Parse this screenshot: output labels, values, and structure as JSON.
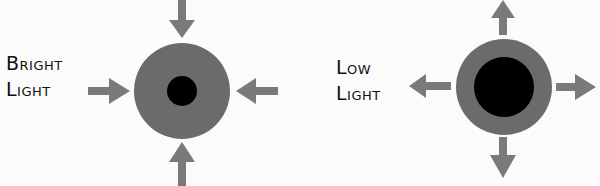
{
  "panels": [
    {
      "id": "bright",
      "label_lines": [
        "Bright",
        "Light"
      ],
      "iris_radius": 48,
      "pupil_radius": 15,
      "arrow_direction": "inward"
    },
    {
      "id": "low",
      "label_lines": [
        "Low",
        "Light"
      ],
      "iris_radius": 48,
      "pupil_radius": 30,
      "arrow_direction": "outward"
    }
  ],
  "colors": {
    "background": "#fbfbfb",
    "iris": "#6b6b6b",
    "pupil": "#000000",
    "arrow": "#7a7a7a",
    "text": "#111111"
  }
}
